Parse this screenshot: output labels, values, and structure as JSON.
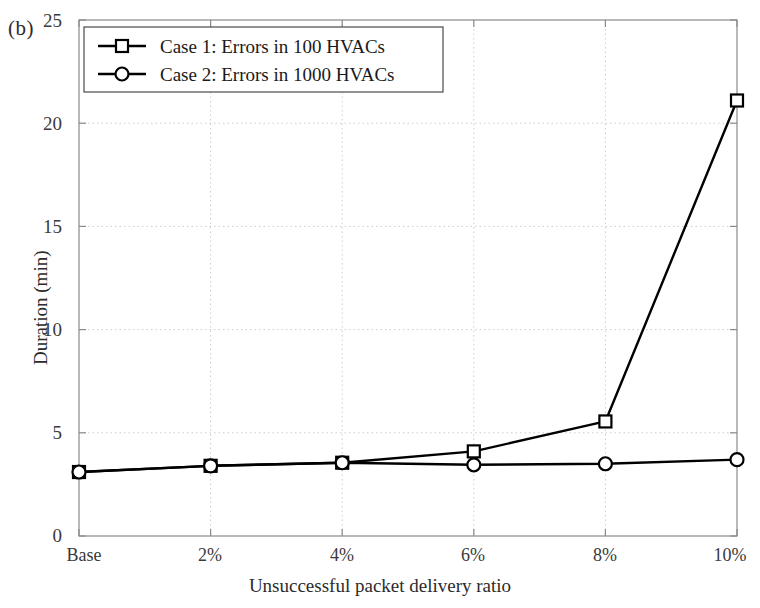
{
  "panel": {
    "label": "(b)"
  },
  "chart_data": {
    "type": "line",
    "title": "",
    "xlabel": "Unsuccessful packet delivery ratio",
    "ylabel": "Duration (min)",
    "categories": [
      "Base",
      "2%",
      "4%",
      "6%",
      "8%",
      "10%"
    ],
    "ylim": [
      0,
      25
    ],
    "yticks": [
      0,
      5,
      10,
      15,
      20,
      25
    ],
    "grid": true,
    "grid_style": "dotted",
    "legend_position": "top-left",
    "series": [
      {
        "name": "Case 1: Errors in 100 HVACs",
        "marker": "square",
        "color": "#000000",
        "values": [
          3.1,
          3.4,
          3.55,
          4.1,
          5.55,
          21.1
        ]
      },
      {
        "name": "Case 2: Errors in 1000 HVACs",
        "marker": "circle",
        "color": "#000000",
        "values": [
          3.1,
          3.4,
          3.55,
          3.45,
          3.5,
          3.7
        ]
      }
    ]
  },
  "axis": {
    "ytick_labels": [
      "25",
      "20",
      "15",
      "10",
      "5",
      "0"
    ],
    "xtick_labels": [
      "Base",
      "2%",
      "4%",
      "6%",
      "8%",
      "10%"
    ]
  },
  "colors": {
    "axis": "#8a8a8a",
    "grid": "#cccccc",
    "line": "#111111",
    "background": "#ffffff"
  }
}
